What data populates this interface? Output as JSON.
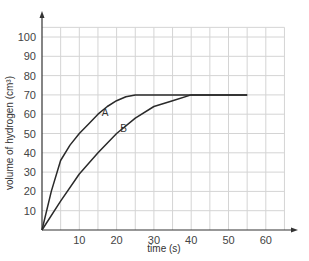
{
  "chart_data": {
    "type": "line",
    "title": "",
    "xlabel": "time (s)",
    "ylabel": "volume of hydrogen (cm³)",
    "xlim": [
      0,
      65
    ],
    "ylim": [
      0,
      110
    ],
    "x_ticks": [
      10,
      20,
      30,
      40,
      50,
      60
    ],
    "y_ticks": [
      10,
      20,
      30,
      40,
      50,
      60,
      70,
      80,
      90,
      100
    ],
    "grid": true,
    "grid_x_step": 5,
    "grid_y_step": 10,
    "legend": "inline labels on curves",
    "series": [
      {
        "name": "A",
        "label_pos": [
          16,
          59
        ],
        "x": [
          0,
          2.5,
          5,
          7.5,
          10,
          12.5,
          15,
          17.5,
          20,
          22.5,
          25,
          30,
          40,
          50,
          55
        ],
        "y": [
          0,
          20,
          36,
          44,
          50,
          55,
          60,
          64,
          67,
          69,
          70,
          70,
          70,
          70,
          70
        ]
      },
      {
        "name": "B",
        "label_pos": [
          21,
          51
        ],
        "x": [
          0,
          5,
          10,
          15,
          20,
          25,
          30,
          35,
          40,
          45,
          50,
          55
        ],
        "y": [
          0,
          15,
          29,
          40,
          50,
          58,
          64,
          67,
          70,
          70,
          70,
          70
        ]
      }
    ]
  }
}
